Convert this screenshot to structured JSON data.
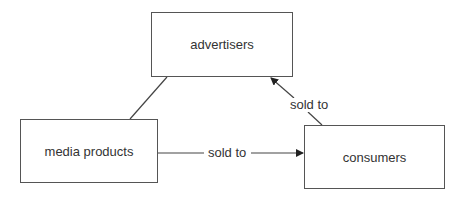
{
  "diagram": {
    "nodes": {
      "advertisers": {
        "label": "advertisers"
      },
      "media_products": {
        "label": "media products"
      },
      "consumers": {
        "label": "consumers"
      }
    },
    "edges": [
      {
        "from": "media products",
        "to": "advertisers",
        "label": "",
        "arrow": false
      },
      {
        "from": "media products",
        "to": "consumers",
        "label": "sold to",
        "arrow": true
      },
      {
        "from": "consumers",
        "to": "advertisers",
        "label": "sold to",
        "arrow": true
      }
    ]
  },
  "labels": {
    "media_to_consumers": "sold to",
    "consumers_to_advertisers": "sold to"
  }
}
